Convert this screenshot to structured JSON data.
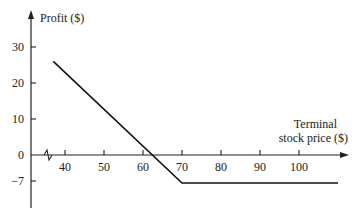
{
  "chart_data": {
    "type": "line",
    "title": "",
    "ylabel": "Profit ($)",
    "xlabel_line1": "Terminal",
    "xlabel_line2": "stock price ($)",
    "x_ticks": [
      40,
      50,
      60,
      70,
      80,
      90,
      100
    ],
    "y_ticks": [
      30,
      20,
      10,
      0,
      -7
    ],
    "x_tick_labels": [
      "40",
      "50",
      "60",
      "70",
      "80",
      "90",
      "100"
    ],
    "y_tick_labels": [
      "30",
      "20",
      "10",
      "0",
      "−7"
    ],
    "xlim": [
      31,
      112
    ],
    "ylim": [
      -14,
      35
    ],
    "axis_break": true,
    "grid": false,
    "legend": null,
    "series": [
      {
        "name": "Long put profit (strike 70, premium 7)",
        "points": [
          [
            37,
            26
          ],
          [
            70,
            -7
          ],
          [
            110,
            -7
          ]
        ]
      }
    ],
    "annotations": [
      "break-even at 63"
    ]
  }
}
